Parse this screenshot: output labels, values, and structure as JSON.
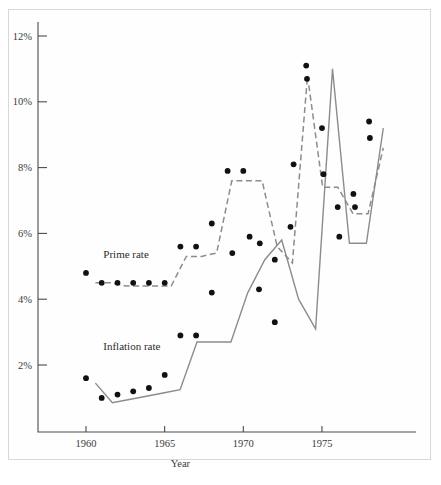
{
  "chart_data": {
    "type": "line",
    "title": "",
    "xlabel": "Year",
    "ylabel": "",
    "xlim": [
      1958.8,
      1979.2
    ],
    "ylim": [
      0,
      12.6
    ],
    "grid": false,
    "legend_position": "inline-annotation",
    "x_ticks": [
      1960,
      1965,
      1970,
      1975
    ],
    "x_tick_labels": [
      "1960",
      "1965",
      "1970",
      "1975"
    ],
    "y_ticks": [
      2,
      4,
      6,
      8,
      10,
      12
    ],
    "y_tick_labels": [
      "2%",
      "4%",
      "6%",
      "8%",
      "10%",
      "12%"
    ],
    "x": [
      1960,
      1961,
      1962,
      1963,
      1964,
      1965,
      1966,
      1967,
      1968,
      1969,
      1970,
      1971,
      1972,
      1973,
      1974,
      1975,
      1976,
      1977,
      1978
    ],
    "series": [
      {
        "name": "Prime rate",
        "style": "dashed",
        "color": "#8c8c8c",
        "label_x": 1961.1,
        "label_y": 5.25,
        "values": [
          4.8,
          4.5,
          4.5,
          4.5,
          4.5,
          4.5,
          5.6,
          5.6,
          6.3,
          7.9,
          7.9,
          5.7,
          5.2,
          8.0,
          10.8,
          7.9,
          6.8,
          6.8,
          9.0
        ],
        "line_values": [
          4.5,
          4.5,
          4.4,
          4.4,
          4.4,
          4.4,
          5.3,
          5.3,
          5.4,
          7.6,
          7.6,
          7.6,
          5.6,
          5.1,
          10.8,
          7.4,
          7.4,
          6.6,
          6.6,
          8.6
        ]
      },
      {
        "name": "Inflation rate",
        "style": "solid",
        "color": "#8c8c8c",
        "label_x": 1961.1,
        "label_y": 2.45,
        "values": [
          1.6,
          1.0,
          1.1,
          1.2,
          1.3,
          1.7,
          2.9,
          2.9,
          4.2,
          5.4,
          5.9,
          5.8,
          4.3,
          3.3,
          9.2,
          7.8,
          6.8,
          7.2,
          9.4
        ],
        "line_values": [
          1.45,
          0.85,
          0.95,
          1.05,
          1.15,
          1.25,
          2.7,
          2.7,
          2.7,
          4.2,
          5.2,
          5.8,
          4.0,
          3.1,
          11.0,
          5.7,
          5.7,
          9.2
        ]
      }
    ],
    "data_points": [
      {
        "series": "Prime rate",
        "year": 1960,
        "value": 4.8
      },
      {
        "series": "Prime rate",
        "year": 1961,
        "value": 4.5
      },
      {
        "series": "Prime rate",
        "year": 1962,
        "value": 4.5
      },
      {
        "series": "Prime rate",
        "year": 1963,
        "value": 4.5
      },
      {
        "series": "Prime rate",
        "year": 1964,
        "value": 4.5
      },
      {
        "series": "Prime rate",
        "year": 1965,
        "value": 4.5
      },
      {
        "series": "Prime rate",
        "year": 1966,
        "value": 5.6
      },
      {
        "series": "Prime rate",
        "year": 1967,
        "value": 5.6
      },
      {
        "series": "Prime rate",
        "year": 1968,
        "value": 6.3
      },
      {
        "series": "Prime rate",
        "year": 1969,
        "value": 7.9
      },
      {
        "series": "Prime rate",
        "year": 1970,
        "value": 7.9
      },
      {
        "series": "Prime rate",
        "year": 1969.3,
        "value": 5.4
      },
      {
        "series": "Prime rate",
        "year": 1970.4,
        "value": 5.9
      },
      {
        "series": "Prime rate",
        "year": 1972,
        "value": 5.2
      },
      {
        "series": "Prime rate",
        "year": 1973,
        "value": 6.2
      },
      {
        "series": "Prime rate",
        "year": 1973.2,
        "value": 8.1
      },
      {
        "series": "Prime rate",
        "year": 1974,
        "value": 11.1
      },
      {
        "series": "Prime rate",
        "year": 1974.05,
        "value": 10.7
      },
      {
        "series": "Prime rate",
        "year": 1975,
        "value": 9.2
      },
      {
        "series": "Prime rate",
        "year": 1975.1,
        "value": 7.8
      },
      {
        "series": "Prime rate",
        "year": 1976,
        "value": 6.8
      },
      {
        "series": "Prime rate",
        "year": 1976.1,
        "value": 5.9
      },
      {
        "series": "Prime rate",
        "year": 1977,
        "value": 7.2
      },
      {
        "series": "Prime rate",
        "year": 1977.1,
        "value": 6.8
      },
      {
        "series": "Prime rate",
        "year": 1978,
        "value": 9.4
      },
      {
        "series": "Prime rate",
        "year": 1978.05,
        "value": 8.9
      },
      {
        "series": "Inflation rate",
        "year": 1960,
        "value": 1.6
      },
      {
        "series": "Inflation rate",
        "year": 1961,
        "value": 1.0
      },
      {
        "series": "Inflation rate",
        "year": 1962,
        "value": 1.1
      },
      {
        "series": "Inflation rate",
        "year": 1963,
        "value": 1.2
      },
      {
        "series": "Inflation rate",
        "year": 1964,
        "value": 1.3
      },
      {
        "series": "Inflation rate",
        "year": 1965,
        "value": 1.7
      },
      {
        "series": "Inflation rate",
        "year": 1966,
        "value": 2.9
      },
      {
        "series": "Inflation rate",
        "year": 1967,
        "value": 2.9
      },
      {
        "series": "Inflation rate",
        "year": 1968,
        "value": 4.2
      },
      {
        "series": "Inflation rate",
        "year": 1971,
        "value": 4.3
      },
      {
        "series": "Inflation rate",
        "year": 1972,
        "value": 3.3
      },
      {
        "series": "Inflation rate",
        "year": 1971.05,
        "value": 5.7
      }
    ]
  },
  "annotations": {
    "prime_rate_label": "Prime rate",
    "inflation_rate_label": "Inflation rate",
    "x_axis_title": "Year"
  }
}
